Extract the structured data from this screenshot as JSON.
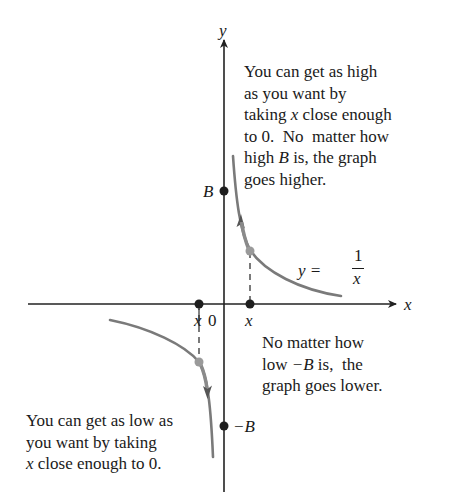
{
  "diagram": {
    "title": "",
    "axes": {
      "x_label": "x",
      "y_label": "y",
      "origin_label": "0"
    },
    "points": {
      "positive_x_label": "x",
      "negative_x_label": "x",
      "B_label": "B",
      "neg_B_label": "−B"
    },
    "equation": {
      "lhs": "y =",
      "numerator": "1",
      "denominator": "x"
    },
    "annotations": {
      "top_right": {
        "lines": [
          "You can get as high",
          "as you want by",
          "taking",
          "x",
          "close enough",
          "to 0.  No  matter how",
          "high",
          "B",
          "is, the graph",
          "goes higher."
        ]
      },
      "middle_right": {
        "line1": "No matter how",
        "line2_a": "low ",
        "line2_b": "−B",
        "line2_c": " is,  the",
        "line3": "graph goes lower."
      },
      "bottom_left": {
        "line1": "You can get as low as",
        "line2": "you want by taking",
        "line3_a": "x",
        "line3_b": " close enough to 0."
      }
    },
    "colors": {
      "axis": "#222222",
      "curve": "#7a7a7a",
      "dot": "#1e1e1e",
      "highlight_dot": "#9a9a9a",
      "text": "#1a1a1a"
    }
  }
}
